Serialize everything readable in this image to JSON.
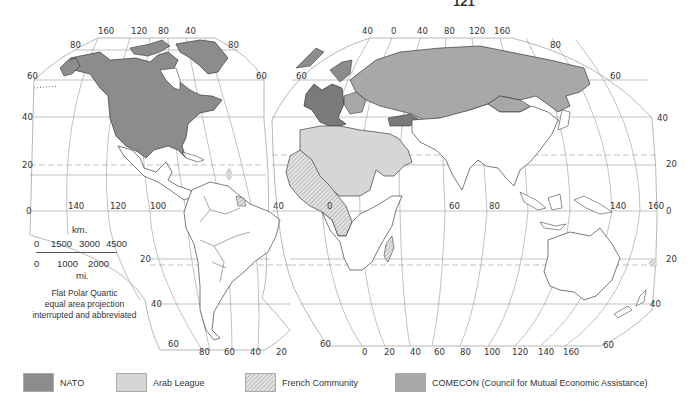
{
  "page": {
    "number": "121"
  },
  "colors": {
    "nato": "#8c8c8c",
    "arab_league": "#d6d6d6",
    "french_community_bg": "#e2e2e2",
    "french_community_hatch": "#9a9a9a",
    "comecon": "#a8a8a8",
    "land_unaffiliated": "#ffffff",
    "graticule": "#888888",
    "coast": "#222222"
  },
  "map": {
    "projection_note": {
      "line1": "Flat Polar Quartic",
      "line2": "equal area projection",
      "line3": "interrupted and abbreviated"
    },
    "scale": {
      "km_unit": "km.",
      "km_ticks": [
        "0",
        "1500",
        "3000",
        "4500"
      ],
      "mi_ticks": [
        "0",
        "1000",
        "2000"
      ],
      "mi_unit": "mi."
    },
    "west_lobe": {
      "top_longitudes": [
        "160",
        "120",
        "80",
        "40"
      ],
      "left_latitudes": [
        "80",
        "60",
        "40",
        "20",
        "0"
      ],
      "right_latitudes": [
        "80",
        "60"
      ],
      "equator_longitudes": [
        "140",
        "120",
        "100",
        "40"
      ],
      "bottom_longitudes": [
        "80",
        "60",
        "40",
        "20"
      ],
      "inner_latitudes": [
        "20",
        "40",
        "60"
      ]
    },
    "east_lobe": {
      "top_longitudes": [
        "40",
        "0",
        "40",
        "80",
        "120",
        "160"
      ],
      "left_latitudes": [
        "60"
      ],
      "right_latitudes": [
        "80",
        "60",
        "40",
        "20",
        "0",
        "20",
        "40",
        "60"
      ],
      "equator_longitudes": [
        "0",
        "60",
        "80",
        "140",
        "160"
      ],
      "bottom_longitudes": [
        "0",
        "20",
        "40",
        "60",
        "80",
        "100",
        "120",
        "140",
        "160"
      ],
      "bottom_left_latitude": "60"
    }
  },
  "legend": {
    "items": [
      {
        "key": "nato",
        "label": "NATO"
      },
      {
        "key": "arab_league",
        "label": "Arab League"
      },
      {
        "key": "french_community",
        "label": "French Community"
      },
      {
        "key": "comecon",
        "label": "COMECON (Council for Mutual Economic Assistance)"
      }
    ]
  }
}
